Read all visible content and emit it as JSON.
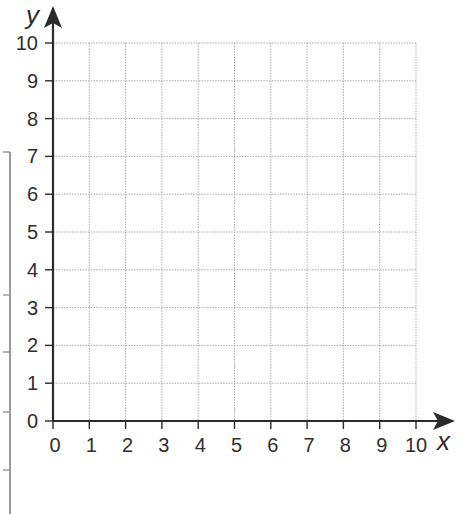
{
  "chart_data": {
    "type": "scatter",
    "title": "",
    "xlabel": "x",
    "ylabel": "y",
    "xlim": [
      0,
      10
    ],
    "ylim": [
      0,
      10
    ],
    "grid": true,
    "x_ticks": [
      0,
      1,
      2,
      3,
      4,
      5,
      6,
      7,
      8,
      9,
      10
    ],
    "y_ticks": [
      0,
      1,
      2,
      3,
      4,
      5,
      6,
      7,
      8,
      9,
      10
    ],
    "x_tick_labels": [
      "0",
      "1",
      "2",
      "3",
      "4",
      "5",
      "6",
      "7",
      "8",
      "9",
      "10"
    ],
    "y_tick_labels": [
      "0",
      "1",
      "2",
      "3",
      "4",
      "5",
      "6",
      "7",
      "8",
      "9",
      "10"
    ],
    "series": [],
    "legend": null
  },
  "axes": {
    "x_title": "x",
    "y_title": "y"
  },
  "colors": {
    "axis": "#2b2b2b",
    "grid": "#a9a9a9",
    "text": "#2e2e2e",
    "background": "#ffffff"
  }
}
